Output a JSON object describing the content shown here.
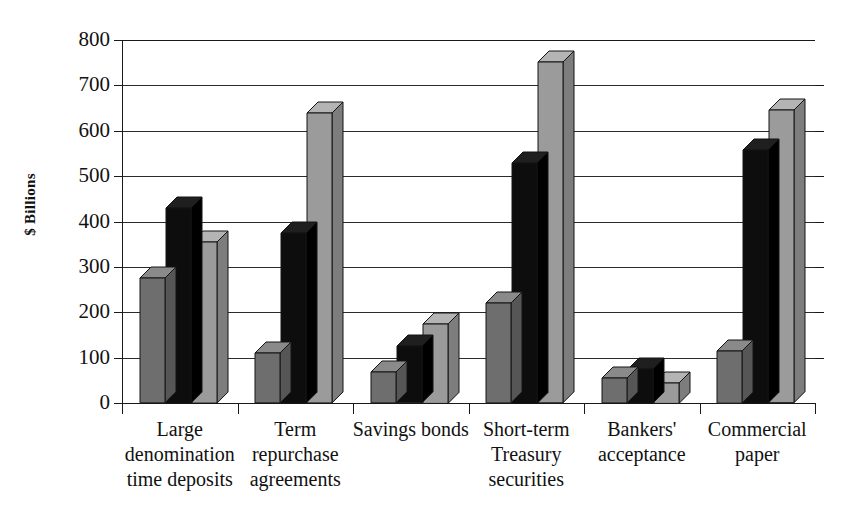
{
  "chart_data": {
    "type": "bar",
    "title": "",
    "subtitle": "",
    "xlabel": "",
    "ylabel": "$ Billions",
    "ylim": [
      0,
      800
    ],
    "ytick_values": [
      0,
      100,
      200,
      300,
      400,
      500,
      600,
      700,
      800
    ],
    "ytick_labels": [
      "0",
      "100",
      "200",
      "300",
      "400",
      "500",
      "600",
      "700",
      "800"
    ],
    "grid": true,
    "legend": "none",
    "bar_style": "3d-column",
    "categories": [
      "Large denomination time deposits",
      "Term repurchase agreements",
      "Savings bonds",
      "Short-term Treasury securities",
      "Bankers' acceptance",
      "Commercial paper"
    ],
    "category_label_lines": [
      [
        "Large",
        "denomination",
        "time deposits"
      ],
      [
        "Term",
        "repurchase",
        "agreements"
      ],
      [
        "Savings bonds"
      ],
      [
        "Short-term",
        "Treasury",
        "securities"
      ],
      [
        "Bankers'",
        "acceptance"
      ],
      [
        "Commercial",
        "paper"
      ]
    ],
    "series": [
      {
        "name": "series-1",
        "color": "#6e6e6e",
        "top_color": "#8a8a8a",
        "side_color": "#565656",
        "values": [
          275,
          110,
          68,
          220,
          55,
          115
        ]
      },
      {
        "name": "series-2",
        "color": "#0d0d0d",
        "top_color": "#1f1f1f",
        "side_color": "#000000",
        "values": [
          430,
          375,
          125,
          530,
          75,
          558
        ]
      },
      {
        "name": "series-3",
        "color": "#9b9b9b",
        "top_color": "#b4b4b4",
        "side_color": "#7d7d7d",
        "values": [
          355,
          639,
          175,
          751,
          45,
          645
        ]
      }
    ]
  },
  "axis": {
    "y_title": "$ Billions"
  }
}
